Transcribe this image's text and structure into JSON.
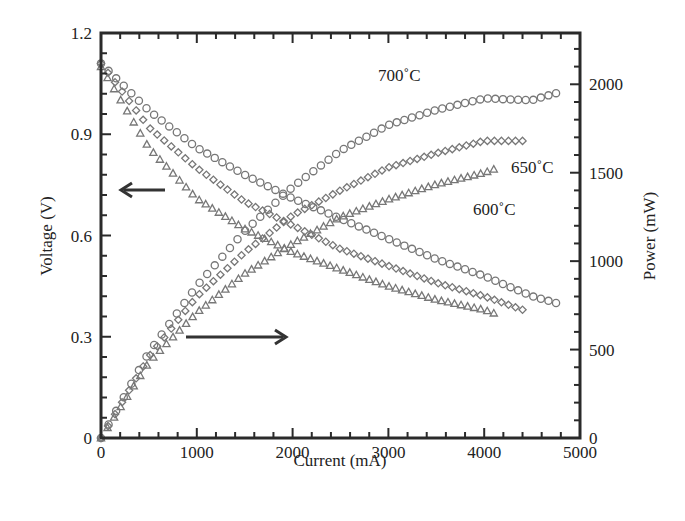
{
  "chart_data": {
    "type": "line",
    "title": "",
    "xlabel": "Current (mA)",
    "ylabel": "Voltage (V)",
    "y2label": "Power (mW)",
    "xlim": [
      0,
      5000
    ],
    "ylim": [
      0,
      1.2
    ],
    "y2lim": [
      0,
      2290
    ],
    "xticks": [
      "0",
      "1000",
      "2000",
      "3000",
      "4000",
      "5000"
    ],
    "yticks": [
      "0",
      "0.3",
      "0.6",
      "0.9",
      "1.2"
    ],
    "y2ticks": [
      "0",
      "500",
      "1000",
      "1500",
      "2000"
    ],
    "grid": false,
    "legend": "inline annotations",
    "x": [
      0,
      500,
      1000,
      1500,
      2000,
      2500,
      3000,
      3500,
      4000,
      4400,
      4750
    ],
    "series": [
      {
        "name": "700°C voltage",
        "axis": "left",
        "marker": "circle",
        "x": [
          0,
          500,
          1000,
          1500,
          2000,
          2500,
          3000,
          3500,
          4000,
          4500,
          4750
        ],
        "values": [
          1.11,
          0.97,
          0.86,
          0.78,
          0.71,
          0.65,
          0.59,
          0.53,
          0.48,
          0.42,
          0.4
        ]
      },
      {
        "name": "650°C voltage",
        "axis": "left",
        "marker": "diamond",
        "x": [
          0,
          500,
          1000,
          1500,
          2000,
          2500,
          3000,
          3500,
          4000,
          4400
        ],
        "values": [
          1.11,
          0.92,
          0.8,
          0.7,
          0.63,
          0.56,
          0.51,
          0.46,
          0.42,
          0.38
        ]
      },
      {
        "name": "600°C voltage",
        "axis": "left",
        "marker": "triangle",
        "x": [
          0,
          500,
          1000,
          1500,
          2000,
          2500,
          3000,
          3500,
          4000,
          4100
        ],
        "values": [
          1.1,
          0.86,
          0.71,
          0.62,
          0.55,
          0.5,
          0.45,
          0.41,
          0.38,
          0.37
        ]
      },
      {
        "name": "700°C power",
        "axis": "right",
        "marker": "circle",
        "x": [
          0,
          500,
          1000,
          1500,
          2000,
          2500,
          3000,
          3500,
          4000,
          4500,
          4750
        ],
        "values": [
          0,
          485,
          860,
          1170,
          1420,
          1625,
          1770,
          1855,
          1920,
          1910,
          1950
        ]
      },
      {
        "name": "650°C power",
        "axis": "right",
        "marker": "diamond",
        "x": [
          0,
          500,
          1000,
          1500,
          2000,
          2500,
          3000,
          3500,
          4000,
          4400
        ],
        "values": [
          0,
          460,
          800,
          1050,
          1260,
          1400,
          1530,
          1610,
          1680,
          1680
        ]
      },
      {
        "name": "600°C power",
        "axis": "right",
        "marker": "triangle",
        "x": [
          0,
          500,
          1000,
          1500,
          2000,
          2500,
          3000,
          3500,
          4000,
          4100
        ],
        "values": [
          0,
          430,
          710,
          930,
          1100,
          1250,
          1350,
          1435,
          1500,
          1520
        ]
      }
    ],
    "annotations": [
      {
        "text": "700°C",
        "near": "700°C power curve"
      },
      {
        "text": "650°C",
        "near": "650°C power curve"
      },
      {
        "text": "600°C",
        "near": "600°C power curve"
      },
      {
        "text": "← (voltage curves read on left axis)",
        "arrow": "left"
      },
      {
        "text": "→ (power curves read on right axis)",
        "arrow": "right"
      }
    ]
  },
  "labels": {
    "xlabel": "Current (mA)",
    "ylabel": "Voltage (V)",
    "y2label": "Power (mW)",
    "t700": "700˚C",
    "t650": "650˚C",
    "t600": "600˚C"
  }
}
